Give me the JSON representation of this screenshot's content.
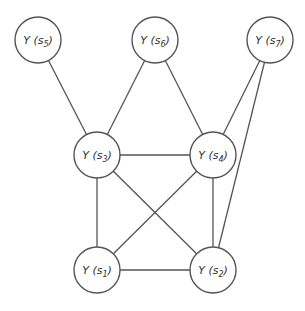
{
  "diagram": {
    "type": "undirected-graph",
    "nodes": [
      {
        "id": "s1",
        "label": "Y",
        "subscript": "1",
        "text": "Y (s1)"
      },
      {
        "id": "s2",
        "label": "Y",
        "subscript": "2",
        "text": "Y (s2)"
      },
      {
        "id": "s3",
        "label": "Y",
        "subscript": "3",
        "text": "Y (s3)"
      },
      {
        "id": "s4",
        "label": "Y",
        "subscript": "4",
        "text": "Y (s4)"
      },
      {
        "id": "s5",
        "label": "Y",
        "subscript": "5",
        "text": "Y (s5)"
      },
      {
        "id": "s6",
        "label": "Y",
        "subscript": "6",
        "text": "Y (s6)"
      },
      {
        "id": "s7",
        "label": "Y",
        "subscript": "7",
        "text": "Y (s7)"
      }
    ],
    "edges": [
      [
        "s5",
        "s3"
      ],
      [
        "s6",
        "s3"
      ],
      [
        "s6",
        "s4"
      ],
      [
        "s7",
        "s4"
      ],
      [
        "s7",
        "s2"
      ],
      [
        "s3",
        "s4"
      ],
      [
        "s3",
        "s1"
      ],
      [
        "s3",
        "s2"
      ],
      [
        "s4",
        "s1"
      ],
      [
        "s4",
        "s2"
      ],
      [
        "s1",
        "s2"
      ]
    ]
  }
}
